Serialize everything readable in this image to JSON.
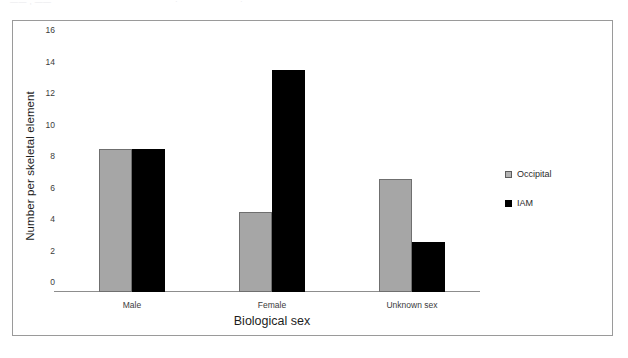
{
  "top_bleed": {
    "fragment_a": "—— , ——",
    "fragment_b": "·",
    "fragment_c": "·"
  },
  "colors": {
    "occipital": "#A6A6A6",
    "occipital_border": "#6F6F6F",
    "iam": "#000000",
    "frame": "#9A9A9A",
    "axis": "#8D8D8D",
    "text": "#1D1D1D"
  },
  "chart_data": {
    "type": "bar",
    "title": "",
    "xlabel": "Biological sex",
    "ylabel": "Number per skeletal element",
    "categories": [
      "Male",
      "Female",
      "Unknown sex"
    ],
    "series": [
      {
        "name": "Occipital",
        "values": [
          9.1,
          5.1,
          7.2
        ]
      },
      {
        "name": "IAM",
        "values": [
          9.1,
          14.1,
          3.2
        ]
      }
    ],
    "ylim": [
      0,
      16
    ],
    "yticks": [
      0,
      2,
      4,
      6,
      8,
      10,
      12,
      14,
      16
    ],
    "ytick_labels": [
      "0",
      "2",
      "4",
      "6",
      "8",
      "10",
      "12",
      "14",
      "16"
    ],
    "grid": false,
    "legend_position": "right",
    "legend_entries": [
      "Occipital",
      "IAM"
    ]
  }
}
